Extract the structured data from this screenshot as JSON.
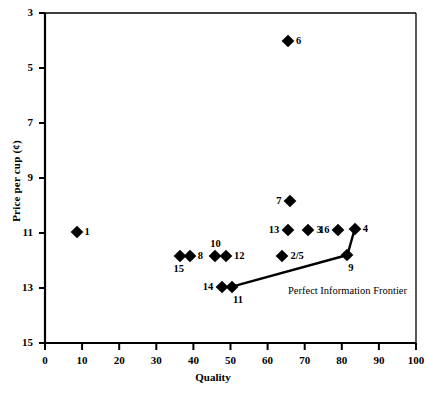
{
  "chart_data": {
    "type": "scatter",
    "title": "",
    "xlabel": "Quality",
    "ylabel": "Price per cup (¢)",
    "xlim": [
      0,
      100
    ],
    "ylim": [
      3,
      15
    ],
    "xticks": [
      0,
      10,
      20,
      30,
      40,
      50,
      60,
      70,
      80,
      90,
      100
    ],
    "yticks": [
      3,
      5,
      7,
      9,
      11,
      13,
      15
    ],
    "grid": false,
    "legend": false,
    "points": [
      {
        "label": "1",
        "x": 8.5,
        "y": 7.05,
        "label_pos": "right"
      },
      {
        "label": "6",
        "x": 65.5,
        "y": 14.0,
        "label_pos": "right"
      },
      {
        "label": "7",
        "x": 66.0,
        "y": 8.15,
        "label_pos": "left"
      },
      {
        "label": "13",
        "x": 65.5,
        "y": 7.1,
        "label_pos": "left"
      },
      {
        "label": "3",
        "x": 71.0,
        "y": 7.1,
        "label_pos": "right"
      },
      {
        "label": "16",
        "x": 79.0,
        "y": 7.1,
        "label_pos": "left"
      },
      {
        "label": "4",
        "x": 83.5,
        "y": 7.15,
        "label_pos": "right"
      },
      {
        "label": "15",
        "x": 36.5,
        "y": 6.15,
        "label_pos": "below-left"
      },
      {
        "label": "8",
        "x": 39.0,
        "y": 6.15,
        "label_pos": "right"
      },
      {
        "label": "10",
        "x": 45.8,
        "y": 6.15,
        "label_pos": "above"
      },
      {
        "label": "12",
        "x": 48.8,
        "y": 6.15,
        "label_pos": "right"
      },
      {
        "label": "2/5",
        "x": 64.0,
        "y": 6.15,
        "label_pos": "right"
      },
      {
        "label": "9",
        "x": 81.5,
        "y": 6.2,
        "label_pos": "below-right"
      },
      {
        "label": "14",
        "x": 47.7,
        "y": 5.05,
        "label_pos": "left"
      },
      {
        "label": "11",
        "x": 50.4,
        "y": 5.05,
        "label_pos": "below-right"
      }
    ],
    "frontier": {
      "name": "Perfect Information Frontier",
      "annotation": "Perfect Information Frontier",
      "points": [
        {
          "x": 50.4,
          "y": 5.05
        },
        {
          "x": 81.5,
          "y": 6.2
        },
        {
          "x": 83.5,
          "y": 7.15
        }
      ]
    }
  },
  "axis": {
    "y_title": "Price per cup (¢)",
    "x_title": "Quality",
    "y_tick_labels": [
      "15",
      "13",
      "11",
      "9",
      "7",
      "5",
      "3"
    ],
    "x_tick_labels": [
      "0",
      "10",
      "20",
      "30",
      "40",
      "50",
      "60",
      "70",
      "80",
      "90",
      "100"
    ]
  },
  "colors": {
    "marker": "#000000",
    "axis": "#000000",
    "background": "#ffffff"
  }
}
